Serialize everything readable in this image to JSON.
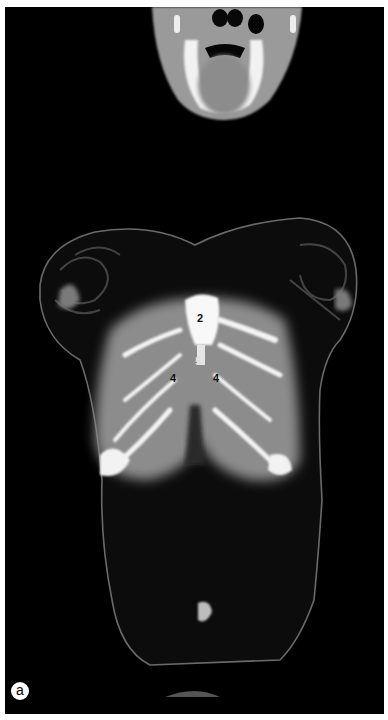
{
  "figure": {
    "panel_letter": "a",
    "labels": [
      {
        "text": "2",
        "x": 197,
        "y": 313
      },
      {
        "text": "5",
        "x": 195,
        "y": 356,
        "light": true
      },
      {
        "text": "4",
        "x": 170,
        "y": 373
      },
      {
        "text": "4",
        "x": 213,
        "y": 373
      }
    ],
    "colors": {
      "background": "#000000",
      "border": "#ffffff",
      "soft_tissue": "#8a8a8a",
      "bone": "#f4f4f4"
    }
  }
}
